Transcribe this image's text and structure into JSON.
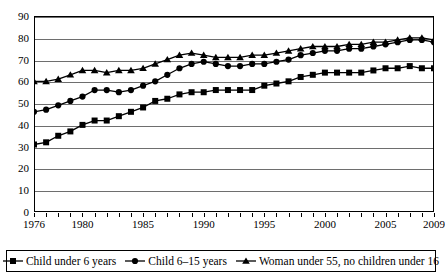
{
  "chart_data": {
    "type": "line",
    "title": "",
    "subtitle": "",
    "xlabel": "",
    "ylabel": "",
    "ylim": [
      0,
      90
    ],
    "ytick_step": 10,
    "yticks": [
      0,
      10,
      20,
      30,
      40,
      50,
      60,
      70,
      80,
      90
    ],
    "xlim": [
      1976,
      2009
    ],
    "xticks_labeled": [
      1976,
      1980,
      1985,
      1990,
      1995,
      2000,
      2005,
      2009
    ],
    "x": [
      1976,
      1977,
      1978,
      1979,
      1980,
      1981,
      1982,
      1983,
      1984,
      1985,
      1986,
      1987,
      1988,
      1989,
      1990,
      1991,
      1992,
      1993,
      1994,
      1995,
      1996,
      1997,
      1998,
      1999,
      2000,
      2001,
      2002,
      2003,
      2004,
      2005,
      2006,
      2007,
      2008,
      2009
    ],
    "grid": true,
    "grid_axis": "y",
    "legend_position": "bottom",
    "series": [
      {
        "name": "Child under 6 years",
        "marker": "square",
        "values": [
          31,
          32,
          35,
          37,
          40,
          42,
          42,
          44,
          46,
          48,
          51,
          52,
          54,
          55,
          55,
          56,
          56,
          56,
          56,
          58,
          59,
          60,
          62,
          63,
          64,
          64,
          64,
          64,
          65,
          66,
          66,
          67,
          66,
          66
        ]
      },
      {
        "name": "Child 6–15 years",
        "marker": "circle",
        "values": [
          46,
          47,
          49,
          51,
          53,
          56,
          56,
          55,
          56,
          58,
          60,
          63,
          66,
          68,
          69,
          68,
          67,
          67,
          68,
          68,
          69,
          70,
          72,
          73,
          74,
          74,
          75,
          75,
          76,
          77,
          78,
          79,
          79,
          78
        ]
      },
      {
        "name": "Woman under 55, no children under 16",
        "marker": "triangle",
        "values": [
          60,
          60,
          61,
          63,
          65,
          65,
          64,
          65,
          65,
          66,
          68,
          70,
          72,
          73,
          72,
          71,
          71,
          71,
          72,
          72,
          73,
          74,
          75,
          76,
          76,
          76,
          77,
          77,
          78,
          78,
          79,
          80,
          80,
          79
        ]
      }
    ]
  },
  "axis": {
    "y_ticks": [
      "0",
      "10",
      "20",
      "30",
      "40",
      "50",
      "60",
      "70",
      "80",
      "90"
    ],
    "x_ticks": [
      "1976",
      "1980",
      "1985",
      "1990",
      "1995",
      "2000",
      "2005",
      "2009"
    ]
  },
  "legend": {
    "items": [
      {
        "label": "Child under 6 years",
        "marker": "square-marker-icon"
      },
      {
        "label": "Child 6–15 years",
        "marker": "circle-marker-icon"
      },
      {
        "label": "Woman under 55, no children under 16",
        "marker": "triangle-marker-icon"
      }
    ]
  },
  "style": {
    "series_color": "#000000",
    "grid_color": "#6e6e6e",
    "axis_color": "#000000",
    "background": "#ffffff"
  }
}
